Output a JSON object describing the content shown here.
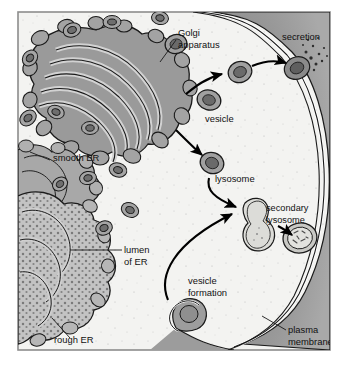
{
  "figure": {
    "frame": {
      "border_color": "#8d8d8d",
      "background": "#f2f2f0"
    },
    "palette": {
      "cytoplasm": "#f3f3f1",
      "golgi_fill": "#9a9a9a",
      "golgi_lumen": "#c9c9c9",
      "rough_er_fill": "#c0c0c0",
      "rough_er_stipple": "#7d7d7d",
      "smooth_er_fill": "#a8a8a8",
      "membrane_fill": "#8e8e8e",
      "vesicle_fill": "#9d9d9d",
      "vesicle_core": "#6e6e6e",
      "outline": "#1a1a1a",
      "arrow": "#000000",
      "label_text": "#111111"
    },
    "labels": [
      {
        "id": "golgi-apparatus",
        "lines": [
          "Golgi",
          "apparatus"
        ],
        "x": 178,
        "y": 36
      },
      {
        "id": "secretion",
        "lines": [
          "secretion"
        ],
        "x": 282,
        "y": 40
      },
      {
        "id": "vesicle",
        "lines": [
          "vesicle"
        ],
        "x": 205,
        "y": 122
      },
      {
        "id": "smooth-er",
        "lines": [
          "smooth ER"
        ],
        "x": 53,
        "y": 161
      },
      {
        "id": "lysosome",
        "lines": [
          "lysosome"
        ],
        "x": 215,
        "y": 182
      },
      {
        "id": "secondary-lysosome",
        "lines": [
          "secondary",
          "lysosome"
        ],
        "x": 266,
        "y": 211
      },
      {
        "id": "lumen-of-er",
        "lines": [
          "lumen",
          "of ER"
        ],
        "x": 124,
        "y": 253
      },
      {
        "id": "vesicle-formation",
        "lines": [
          "vesicle",
          "formation"
        ],
        "x": 188,
        "y": 284
      },
      {
        "id": "rough-er",
        "lines": [
          "rough ER"
        ],
        "x": 54,
        "y": 343
      },
      {
        "id": "plasma-membrane",
        "lines": [
          "plasma",
          "membrane"
        ],
        "x": 288,
        "y": 333
      }
    ],
    "structures": [
      {
        "id": "golgi-apparatus",
        "cisternae": 6,
        "description": "stack of curved flattened cisternae with bulbous lobes"
      },
      {
        "id": "rough-er",
        "description": "stippled membrane network with ribosomes"
      },
      {
        "id": "smooth-er",
        "description": "lobed tubular membrane network without ribosomes"
      },
      {
        "id": "plasma-membrane",
        "description": "dark double-layer band along right and bottom edge"
      },
      {
        "id": "secondary-lysosome",
        "description": "round vesicle containing digested debris"
      },
      {
        "id": "fusion-vesicle",
        "description": "peanut-shaped fusing lysosome and endosome"
      },
      {
        "id": "endocytic-pit",
        "description": "plasma membrane invagination forming a vesicle"
      }
    ],
    "arrows": [
      {
        "id": "golgi-to-vesicle",
        "from": "golgi-apparatus",
        "to": "vesicle"
      },
      {
        "id": "vesicle-to-secretion",
        "from": "vesicle",
        "to": "plasma-membrane"
      },
      {
        "id": "golgi-to-lysosome",
        "from": "golgi-apparatus",
        "to": "lysosome"
      },
      {
        "id": "lysosome-to-fusion",
        "from": "lysosome",
        "to": "fusion-vesicle"
      },
      {
        "id": "endocytic-to-fusion",
        "from": "endocytic-pit",
        "to": "fusion-vesicle"
      },
      {
        "id": "fusion-to-secondary",
        "from": "fusion-vesicle",
        "to": "secondary-lysosome"
      }
    ]
  }
}
